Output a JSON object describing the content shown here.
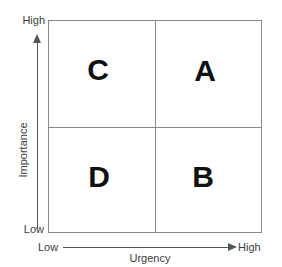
{
  "diagram": {
    "type": "2x2-matrix",
    "x_axis": {
      "title": "Urgency",
      "low_label": "Low",
      "high_label": "High",
      "direction": "left-to-right"
    },
    "y_axis": {
      "title": "Importance",
      "low_label": "Low",
      "high_label": "High",
      "direction": "bottom-to-top"
    },
    "quadrants": [
      {
        "key": "C",
        "label": "C",
        "position": "top-left",
        "urgency": "Low",
        "importance": "High"
      },
      {
        "key": "A",
        "label": "A",
        "position": "top-right",
        "urgency": "High",
        "importance": "High"
      },
      {
        "key": "D",
        "label": "D",
        "position": "bottom-left",
        "urgency": "Low",
        "importance": "Low"
      },
      {
        "key": "B",
        "label": "B",
        "position": "bottom-right",
        "urgency": "High",
        "importance": "Low"
      }
    ],
    "colors": {
      "background": "#ffffff",
      "grid_line": "#8a8a8a",
      "axis_line": "#555555",
      "label_text": "#3d3d3d",
      "quadrant_text": "#111111"
    }
  },
  "chart_data": {
    "type": "table",
    "title": "",
    "xlabel": "Urgency",
    "ylabel": "Importance",
    "categories": [
      "Low Urgency",
      "High Urgency"
    ],
    "rows": [
      "High Importance",
      "Low Importance"
    ],
    "cells": [
      [
        "C",
        "A"
      ],
      [
        "D",
        "B"
      ]
    ],
    "xlim": [
      "Low",
      "High"
    ],
    "ylim": [
      "Low",
      "High"
    ],
    "grid": true,
    "legend": "none"
  }
}
